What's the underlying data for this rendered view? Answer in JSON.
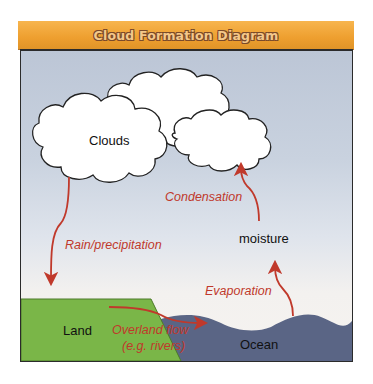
{
  "header": {
    "title": "Cloud Formation Diagram"
  },
  "labels": {
    "clouds": "Clouds",
    "moisture": "moisture",
    "land": "Land",
    "ocean": "Ocean"
  },
  "processes": {
    "condensation": "Condensation",
    "rain": "Rain/precipitation",
    "evaporation": "Evaporation",
    "overland_line1": "Overland flow",
    "overland_line2": "(e.g. rivers)"
  },
  "colors": {
    "header": "#ee9f2f",
    "arrow": "#c0392b",
    "land": "#7ab648",
    "ocean": "#5a6585",
    "cloud": "#ffffff",
    "sky_top": "#bcc6d6"
  }
}
